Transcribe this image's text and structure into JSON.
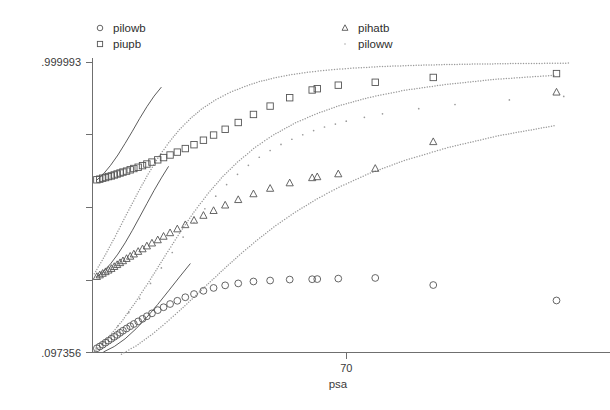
{
  "chart_data": {
    "type": "scatter",
    "title": "",
    "xlabel": "psa",
    "ylabel": "",
    "xlim": [
      0,
      140
    ],
    "ylim": [
      0.097356,
      0.999993
    ],
    "grid": false,
    "legend_position": "top",
    "xticks": [
      {
        "value": 70,
        "label": "70"
      }
    ],
    "yticks": [
      {
        "value": 0.999993,
        "label": ".999993"
      },
      {
        "value": 0.774,
        "label": ""
      },
      {
        "value": 0.548,
        "label": ""
      },
      {
        "value": 0.322,
        "label": ""
      },
      {
        "value": 0.097356,
        "label": ".097356"
      }
    ],
    "series": [
      {
        "name": "pilowb",
        "marker": "circle",
        "points": [
          [
            1.2,
            0.1105
          ],
          [
            2.0,
            0.116
          ],
          [
            2.8,
            0.1215
          ],
          [
            3.6,
            0.128
          ],
          [
            4.4,
            0.134
          ],
          [
            5.2,
            0.14
          ],
          [
            6.0,
            0.146
          ],
          [
            6.8,
            0.152
          ],
          [
            7.6,
            0.1585
          ],
          [
            8.4,
            0.165
          ],
          [
            9.4,
            0.172
          ],
          [
            10.4,
            0.179
          ],
          [
            11.4,
            0.186
          ],
          [
            12.6,
            0.194
          ],
          [
            13.8,
            0.202
          ],
          [
            15.0,
            0.21
          ],
          [
            16.4,
            0.219
          ],
          [
            18.0,
            0.229
          ],
          [
            19.6,
            0.238
          ],
          [
            21.4,
            0.248
          ],
          [
            23.4,
            0.258
          ],
          [
            25.6,
            0.269
          ],
          [
            28.0,
            0.279
          ],
          [
            30.6,
            0.289
          ],
          [
            33.4,
            0.298
          ],
          [
            36.6,
            0.306
          ],
          [
            40.2,
            0.312
          ],
          [
            44.4,
            0.318
          ],
          [
            49.0,
            0.321
          ],
          [
            54.4,
            0.324
          ],
          [
            60.6,
            0.325
          ],
          [
            62.0,
            0.3255
          ],
          [
            67.8,
            0.327
          ],
          [
            78.0,
            0.329
          ],
          [
            94.0,
            0.307
          ],
          [
            128.0,
            0.259
          ]
        ]
      },
      {
        "name": "piupb",
        "marker": "square",
        "points": [
          [
            1.2,
            0.634
          ],
          [
            2.0,
            0.636
          ],
          [
            2.8,
            0.639
          ],
          [
            3.6,
            0.641
          ],
          [
            4.4,
            0.644
          ],
          [
            5.2,
            0.646
          ],
          [
            6.0,
            0.649
          ],
          [
            6.8,
            0.652
          ],
          [
            7.6,
            0.655
          ],
          [
            8.4,
            0.658
          ],
          [
            9.4,
            0.661
          ],
          [
            10.4,
            0.665
          ],
          [
            11.4,
            0.669
          ],
          [
            12.6,
            0.673
          ],
          [
            13.8,
            0.678
          ],
          [
            15.0,
            0.683
          ],
          [
            16.4,
            0.689
          ],
          [
            18.0,
            0.696
          ],
          [
            19.6,
            0.703
          ],
          [
            21.4,
            0.711
          ],
          [
            23.4,
            0.72
          ],
          [
            25.6,
            0.731
          ],
          [
            28.0,
            0.743
          ],
          [
            30.6,
            0.757
          ],
          [
            33.4,
            0.773
          ],
          [
            36.6,
            0.791
          ],
          [
            40.2,
            0.812
          ],
          [
            44.4,
            0.837
          ],
          [
            49.0,
            0.863
          ],
          [
            54.4,
            0.889
          ],
          [
            60.6,
            0.913
          ],
          [
            62.0,
            0.917
          ],
          [
            67.8,
            0.928
          ],
          [
            78.0,
            0.937
          ],
          [
            94.0,
            0.952
          ],
          [
            128.0,
            0.964
          ]
        ]
      },
      {
        "name": "pihatb",
        "marker": "triangle",
        "points": [
          [
            1.2,
            0.333
          ],
          [
            2.0,
            0.338
          ],
          [
            2.8,
            0.343
          ],
          [
            3.6,
            0.348
          ],
          [
            4.4,
            0.353
          ],
          [
            5.2,
            0.358
          ],
          [
            6.0,
            0.364
          ],
          [
            6.8,
            0.37
          ],
          [
            7.6,
            0.376
          ],
          [
            8.4,
            0.382
          ],
          [
            9.4,
            0.389
          ],
          [
            10.4,
            0.396
          ],
          [
            11.4,
            0.403
          ],
          [
            12.6,
            0.411
          ],
          [
            13.8,
            0.419
          ],
          [
            15.0,
            0.428
          ],
          [
            16.4,
            0.437
          ],
          [
            18.0,
            0.447
          ],
          [
            19.6,
            0.458
          ],
          [
            21.4,
            0.469
          ],
          [
            23.4,
            0.481
          ],
          [
            25.6,
            0.494
          ],
          [
            28.0,
            0.508
          ],
          [
            30.6,
            0.523
          ],
          [
            33.4,
            0.538
          ],
          [
            36.6,
            0.555
          ],
          [
            40.2,
            0.572
          ],
          [
            44.4,
            0.59
          ],
          [
            49.0,
            0.607
          ],
          [
            54.4,
            0.624
          ],
          [
            60.6,
            0.64
          ],
          [
            62.0,
            0.643
          ],
          [
            67.8,
            0.652
          ],
          [
            78.0,
            0.669
          ],
          [
            94.0,
            0.752
          ],
          [
            128.0,
            0.906
          ]
        ]
      },
      {
        "name": "piloww",
        "marker": "dot",
        "points": [
          [
            1.0,
            0.111
          ],
          [
            4.0,
            0.143
          ],
          [
            7.0,
            0.18
          ],
          [
            10.0,
            0.221
          ],
          [
            13.0,
            0.265
          ],
          [
            16.0,
            0.312
          ],
          [
            19.0,
            0.36
          ],
          [
            22.0,
            0.408
          ],
          [
            25.0,
            0.456
          ],
          [
            28.0,
            0.501
          ],
          [
            31.0,
            0.544
          ],
          [
            34.0,
            0.583
          ],
          [
            37.0,
            0.619
          ],
          [
            40.0,
            0.651
          ],
          [
            43.0,
            0.679
          ],
          [
            46.0,
            0.704
          ],
          [
            49.0,
            0.725
          ],
          [
            52.0,
            0.744
          ],
          [
            55.0,
            0.76
          ],
          [
            58.0,
            0.774
          ],
          [
            61.0,
            0.787
          ],
          [
            64.0,
            0.798
          ],
          [
            67.0,
            0.807
          ],
          [
            70.0,
            0.816
          ],
          [
            75.0,
            0.828
          ],
          [
            80.0,
            0.839
          ],
          [
            90.0,
            0.855
          ],
          [
            100.0,
            0.868
          ],
          [
            115.0,
            0.882
          ],
          [
            130.0,
            0.893
          ]
        ]
      }
    ],
    "fit_curves": [
      {
        "name": "piloww-upper-band",
        "style": "dotted",
        "points": [
          [
            0.5,
            0.342
          ],
          [
            3.0,
            0.39
          ],
          [
            6.0,
            0.452
          ],
          [
            9.0,
            0.518
          ],
          [
            12.0,
            0.583
          ],
          [
            15.0,
            0.645
          ],
          [
            18.0,
            0.701
          ],
          [
            21.0,
            0.749
          ],
          [
            24.0,
            0.79
          ],
          [
            27.0,
            0.824
          ],
          [
            30.0,
            0.853
          ],
          [
            34.0,
            0.883
          ],
          [
            38.0,
            0.906
          ],
          [
            42.0,
            0.924
          ],
          [
            46.0,
            0.939
          ],
          [
            50.0,
            0.95
          ],
          [
            55.0,
            0.961
          ],
          [
            60.0,
            0.969
          ],
          [
            66.0,
            0.976
          ],
          [
            72.0,
            0.981
          ],
          [
            80.0,
            0.986
          ],
          [
            90.0,
            0.99
          ],
          [
            102.0,
            0.993
          ],
          [
            116.0,
            0.995
          ],
          [
            132.0,
            0.9965
          ]
        ]
      },
      {
        "name": "piloww-mid-band",
        "style": "dotted",
        "points": [
          [
            0.5,
            0.1
          ],
          [
            4.0,
            0.139
          ],
          [
            8.0,
            0.193
          ],
          [
            12.0,
            0.256
          ],
          [
            16.0,
            0.325
          ],
          [
            20.0,
            0.397
          ],
          [
            24.0,
            0.468
          ],
          [
            28.0,
            0.534
          ],
          [
            32.0,
            0.593
          ],
          [
            36.0,
            0.645
          ],
          [
            40.0,
            0.689
          ],
          [
            45.0,
            0.736
          ],
          [
            50.0,
            0.774
          ],
          [
            56.0,
            0.811
          ],
          [
            62.0,
            0.84
          ],
          [
            68.0,
            0.864
          ],
          [
            76.0,
            0.889
          ],
          [
            86.0,
            0.912
          ],
          [
            98.0,
            0.931
          ],
          [
            112.0,
            0.947
          ],
          [
            128.0,
            0.959
          ]
        ]
      },
      {
        "name": "piloww-lower-band",
        "style": "dotted",
        "points": [
          [
            8.0,
            0.092
          ],
          [
            12.0,
            0.118
          ],
          [
            16.0,
            0.15
          ],
          [
            20.0,
            0.187
          ],
          [
            24.0,
            0.227
          ],
          [
            28.0,
            0.269
          ],
          [
            32.0,
            0.312
          ],
          [
            36.0,
            0.354
          ],
          [
            40.0,
            0.395
          ],
          [
            45.0,
            0.443
          ],
          [
            50.0,
            0.487
          ],
          [
            56.0,
            0.534
          ],
          [
            62.0,
            0.575
          ],
          [
            68.0,
            0.611
          ],
          [
            76.0,
            0.652
          ],
          [
            86.0,
            0.694
          ],
          [
            98.0,
            0.734
          ],
          [
            112.0,
            0.771
          ],
          [
            128.0,
            0.803
          ]
        ]
      },
      {
        "name": "solid-fit-upper",
        "style": "solid",
        "points": [
          [
            1.0,
            0.631
          ],
          [
            3.0,
            0.652
          ],
          [
            5.0,
            0.679
          ],
          [
            7.0,
            0.711
          ],
          [
            9.0,
            0.747
          ],
          [
            11.0,
            0.785
          ],
          [
            13.0,
            0.824
          ],
          [
            15.0,
            0.861
          ],
          [
            17.0,
            0.894
          ],
          [
            19.0,
            0.922
          ]
        ]
      },
      {
        "name": "solid-fit-lower",
        "style": "solid",
        "points": [
          [
            1.0,
            0.331
          ],
          [
            3.0,
            0.349
          ],
          [
            5.0,
            0.373
          ],
          [
            7.0,
            0.403
          ],
          [
            9.0,
            0.438
          ],
          [
            11.0,
            0.477
          ],
          [
            13.0,
            0.518
          ],
          [
            15.0,
            0.56
          ],
          [
            17.0,
            0.601
          ],
          [
            19.0,
            0.64
          ],
          [
            21.0,
            0.676
          ]
        ]
      },
      {
        "name": "solid-fit-bottom",
        "style": "solid",
        "points": [
          [
            3.0,
            0.099
          ],
          [
            6.0,
            0.116
          ],
          [
            9.0,
            0.14
          ],
          [
            12.0,
            0.171
          ],
          [
            15.0,
            0.207
          ],
          [
            18.0,
            0.247
          ],
          [
            21.0,
            0.289
          ],
          [
            24.0,
            0.332
          ],
          [
            27.0,
            0.374
          ]
        ]
      }
    ],
    "legend": [
      {
        "label": "pilowb",
        "marker": "circle"
      },
      {
        "label": "piupb",
        "marker": "square"
      },
      {
        "label": "pihatb",
        "marker": "triangle"
      },
      {
        "label": "piloww",
        "marker": "dot"
      }
    ]
  }
}
